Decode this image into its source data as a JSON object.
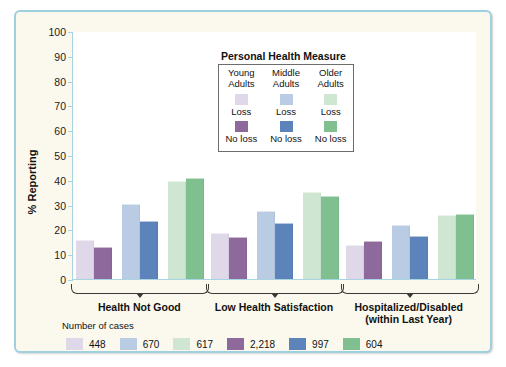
{
  "chart_data": {
    "type": "bar",
    "title": "",
    "xlabel": "",
    "ylabel": "% Reporting",
    "ylim": [
      0,
      100
    ],
    "yticks": [
      0,
      10,
      20,
      30,
      40,
      50,
      60,
      70,
      80,
      90,
      100
    ],
    "grid": false,
    "legend_position": "inside-top-center",
    "categories": [
      "Health Not Good",
      "Low Health Satisfaction",
      "Hospitalized/Disabled (within Last Year)"
    ],
    "series": [
      {
        "name": "Young Adults Loss",
        "color": "#ded8e8",
        "values": [
          15.5,
          18.0,
          13.5
        ]
      },
      {
        "name": "Young Adults No loss",
        "color": "#8e6a9c",
        "values": [
          12.5,
          16.5,
          15.0
        ]
      },
      {
        "name": "Middle Adults Loss",
        "color": "#b9cce4",
        "values": [
          30.0,
          27.0,
          21.5
        ]
      },
      {
        "name": "Middle Adults No loss",
        "color": "#5d83bb",
        "values": [
          23.0,
          22.0,
          17.0
        ]
      },
      {
        "name": "Older Adults Loss",
        "color": "#cfe7d2",
        "values": [
          39.0,
          34.5,
          25.5
        ]
      },
      {
        "name": "Older Adults No loss",
        "color": "#7fbf90",
        "values": [
          40.5,
          33.0,
          26.0
        ]
      }
    ]
  },
  "group_labels": [
    {
      "line1": "Health Not Good",
      "line2": ""
    },
    {
      "line1": "Low Health Satisfaction",
      "line2": ""
    },
    {
      "line1": "Hospitalized/Disabled",
      "line2": "(within Last Year)"
    }
  ],
  "legend": {
    "title": "Personal Health Measure",
    "columns": [
      {
        "head_line1": "Young",
        "head_line2": "Adults",
        "loss_label": "Loss",
        "loss_color": "#ded8e8",
        "noloss_label": "No loss",
        "noloss_color": "#8e6a9c"
      },
      {
        "head_line1": "Middle",
        "head_line2": "Adults",
        "loss_label": "Loss",
        "loss_color": "#b9cce4",
        "noloss_label": "No loss",
        "noloss_color": "#5d83bb"
      },
      {
        "head_line1": "Older",
        "head_line2": "Adults",
        "loss_label": "Loss",
        "loss_color": "#cfe7d2",
        "noloss_label": "No loss",
        "noloss_color": "#7fbf90"
      }
    ]
  },
  "cases_legend": {
    "title": "Number of cases",
    "items": [
      {
        "value": "448",
        "color": "#ded8e8"
      },
      {
        "value": "670",
        "color": "#b9cce4"
      },
      {
        "value": "617",
        "color": "#cfe7d2"
      },
      {
        "value": "2,218",
        "color": "#8e6a9c"
      },
      {
        "value": "997",
        "color": "#5d83bb"
      },
      {
        "value": "604",
        "color": "#7fbf90"
      }
    ]
  },
  "yticks": {
    "t0": "0",
    "t1": "10",
    "t2": "20",
    "t3": "30",
    "t4": "40",
    "t5": "50",
    "t6": "60",
    "t7": "70",
    "t8": "80",
    "t9": "90",
    "t10": "100"
  },
  "colors": {
    "frame_border": "#9fd0e0",
    "frame_bg": "#fbf9ee",
    "axis": "#a8d4e4",
    "plot_bg": "#ffffff",
    "text": "#111111"
  }
}
